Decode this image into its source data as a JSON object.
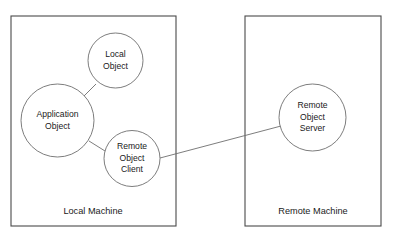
{
  "diagram": {
    "background_color": "#ffffff",
    "box_stroke_color": "#4a4a4a",
    "circle_stroke_color": "#6e6e6e",
    "text_color": "#1a1a1a",
    "boxes": [
      {
        "id": "local-machine",
        "label": "Local Machine",
        "x": 11,
        "y": 16,
        "width": 165,
        "height": 210,
        "label_x": 93,
        "label_y": 212
      },
      {
        "id": "remote-machine",
        "label": "Remote Machine",
        "x": 245,
        "y": 16,
        "width": 136,
        "height": 210,
        "label_x": 313,
        "label_y": 212
      }
    ],
    "nodes": [
      {
        "id": "local-object",
        "label_lines": [
          "Local",
          "Object"
        ],
        "line1": "Local",
        "line2": "Object",
        "line3": "",
        "cx": 115.5,
        "cy": 60.5,
        "r": 27.5
      },
      {
        "id": "application-object",
        "label_lines": [
          "Application",
          "Object"
        ],
        "line1": "Application",
        "line2": "Object",
        "line3": "",
        "cx": 57.5,
        "cy": 120.5,
        "r": 36.5
      },
      {
        "id": "remote-object-client",
        "label_lines": [
          "Remote",
          "Object",
          "Client"
        ],
        "line1": "Remote",
        "line2": "Object",
        "line3": "Client",
        "cx": 132,
        "cy": 158.5,
        "r": 28
      },
      {
        "id": "remote-object-server",
        "label_lines": [
          "Remote",
          "Object",
          "Server"
        ],
        "line1": "Remote",
        "line2": "Object",
        "line3": "Server",
        "cx": 312.5,
        "cy": 117.5,
        "r": 33.5
      }
    ],
    "connectors": [
      {
        "id": "application-to-local-object",
        "from": "application-object",
        "to": "local-object",
        "x1": 82,
        "y1": 98,
        "x2": 96,
        "y2": 84
      },
      {
        "id": "application-to-remote-client",
        "from": "application-object",
        "to": "remote-object-client",
        "x1": 89,
        "y1": 141,
        "x2": 105,
        "y2": 151
      },
      {
        "id": "remote-client-to-remote-server",
        "from": "remote-object-client",
        "to": "remote-object-server",
        "x1": 160,
        "y1": 158,
        "x2": 281,
        "y2": 126
      }
    ]
  }
}
